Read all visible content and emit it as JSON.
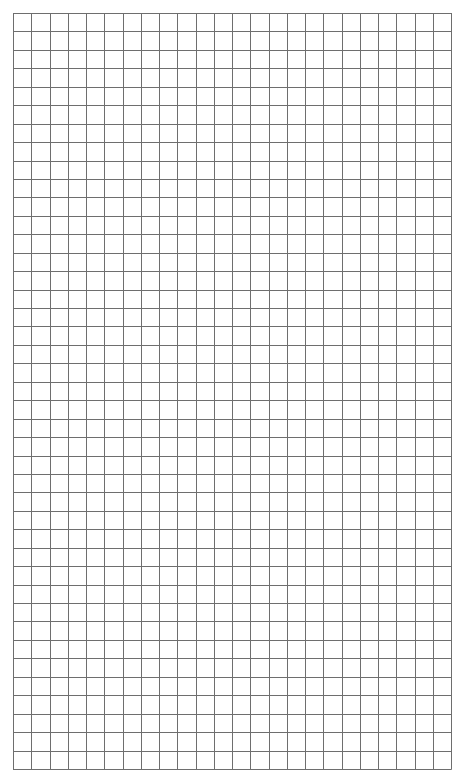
{
  "sheet": {
    "type": "graph-paper",
    "columns": 24,
    "rows": 41,
    "origin": [
      13,
      13
    ],
    "width": 438,
    "height": 756,
    "line_color": "#6e6e6e",
    "background": "#ffffff"
  }
}
